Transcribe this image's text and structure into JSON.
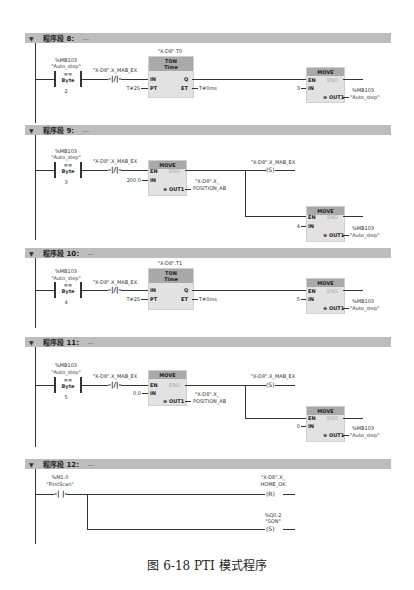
{
  "networks": [
    {
      "title": "程序段 8：",
      "comment": "...",
      "compare": {
        "address": "%MB103",
        "tag": "\"Auto_step\"",
        "op": "==",
        "type": "Byte",
        "value": "2"
      },
      "nc_contact": {
        "tag": "\"X-D8\".X_MAB_EX"
      },
      "timer": {
        "instance": "\"X-D8\".T0",
        "type": "TON",
        "sub": "Time",
        "pin_in": "IN",
        "pin_pt": "PT",
        "pin_q": "Q",
        "pin_et": "ET",
        "pt_value": "T#2S",
        "et_value": "T#0ms"
      },
      "move": {
        "title": "MOVE",
        "en": "EN",
        "eno": "ENO",
        "in": "IN",
        "out": "OUT1",
        "in_value": "3",
        "out_address": "%MB103",
        "out_tag": "\"Auto_step\""
      }
    },
    {
      "title": "程序段 9：",
      "comment": "...",
      "compare": {
        "address": "%MB103",
        "tag": "\"Auto_step\"",
        "op": "==",
        "type": "Byte",
        "value": "3"
      },
      "nc_contact": {
        "tag": "\"X-D8\".X_MAB_EX"
      },
      "move1": {
        "title": "MOVE",
        "en": "EN",
        "eno": "ENO",
        "in": "IN",
        "out": "OUT1",
        "in_value": "200.0",
        "out_tag_line1": "\"X-D8\".X_",
        "out_tag_line2": "POSITION_AB"
      },
      "set_coil": {
        "tag": "\"X-D8\".X_MAB_EX",
        "symbol": "S"
      },
      "move2": {
        "title": "MOVE",
        "en": "EN",
        "eno": "ENO",
        "in": "IN",
        "out": "OUT1",
        "in_value": "4",
        "out_address": "%MB103",
        "out_tag": "\"Auto_step\""
      }
    },
    {
      "title": "程序段 10：",
      "comment": "...",
      "compare": {
        "address": "%MB103",
        "tag": "\"Auto_step\"",
        "op": "==",
        "type": "Byte",
        "value": "4"
      },
      "nc_contact": {
        "tag": "\"X-D8\".X_MAB_EX"
      },
      "timer": {
        "instance": "\"X-D8\".T1",
        "type": "TON",
        "sub": "Time",
        "pin_in": "IN",
        "pin_pt": "PT",
        "pin_q": "Q",
        "pin_et": "ET",
        "pt_value": "T#2S",
        "et_value": "T#0ms"
      },
      "move": {
        "title": "MOVE",
        "en": "EN",
        "eno": "ENO",
        "in": "IN",
        "out": "OUT1",
        "in_value": "5",
        "out_address": "%MB103",
        "out_tag": "\"Auto_step\""
      }
    },
    {
      "title": "程序段 11：",
      "comment": "...",
      "compare": {
        "address": "%MB103",
        "tag": "\"Auto_step\"",
        "op": "==",
        "type": "Byte",
        "value": "5"
      },
      "nc_contact": {
        "tag": "\"X-D8\".X_MAB_EX"
      },
      "move1": {
        "title": "MOVE",
        "en": "EN",
        "eno": "ENO",
        "in": "IN",
        "out": "OUT1",
        "in_value": "0.0",
        "out_tag_line1": "\"X-D8\".X_",
        "out_tag_line2": "POSITION_AB"
      },
      "set_coil": {
        "tag": "\"X-D8\".X_MAB_EX",
        "symbol": "S"
      },
      "move2": {
        "title": "MOVE",
        "en": "EN",
        "eno": "ENO",
        "in": "IN",
        "out": "OUT1",
        "in_value": "0",
        "out_address": "%MB103",
        "out_tag": "\"Auto_step\""
      }
    },
    {
      "title": "程序段 12：",
      "comment": "...",
      "no_contact": {
        "address": "%M1.0",
        "tag": "\"FirstScan\""
      },
      "reset_coil": {
        "tag_line1": "\"X-D8\".X_",
        "tag_line2": "HOME_OK",
        "symbol": "R"
      },
      "set_coil": {
        "address": "%Q0.2",
        "tag": "\"SON\"",
        "symbol": "S"
      }
    }
  ],
  "caption": "图 6-18    PTI 模式程序",
  "icons": {
    "collapse": "▼",
    "out_marker": "⊕"
  }
}
